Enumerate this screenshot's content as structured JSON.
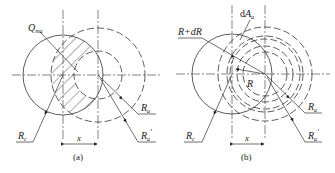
{
  "figures": [
    {
      "id": "a",
      "caption": "(a)",
      "labels": {
        "q": "Q",
        "q_sub": "ma",
        "ra": "R",
        "ra_sub": "a",
        "ra_prime": "R",
        "ra_prime_sub": "a",
        "ra_prime_mark": "′",
        "rc": "R",
        "rc_sub": "c",
        "x": "x"
      }
    },
    {
      "id": "b",
      "caption": "(b)",
      "labels": {
        "rdr": "R+dR",
        "da": "dA",
        "da_sub": "a",
        "r": "R",
        "ra": "R",
        "ra_sub": "a",
        "ra_prime": "R",
        "ra_prime_sub": "a",
        "ra_prime_mark": "′",
        "rc": "R",
        "rc_sub": "c",
        "x": "x"
      }
    }
  ]
}
